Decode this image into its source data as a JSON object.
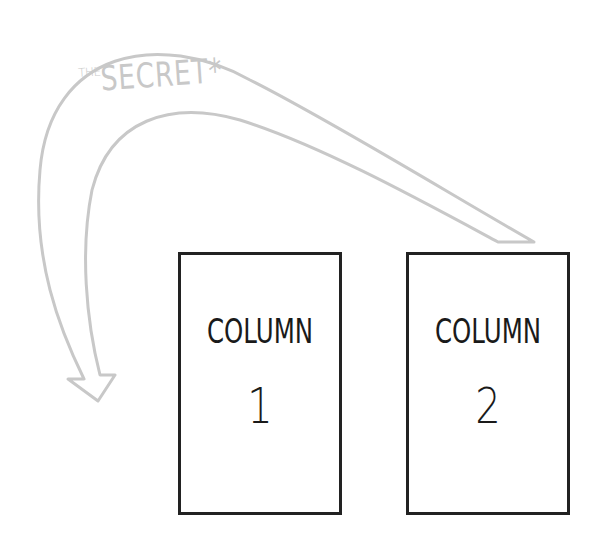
{
  "diagram": {
    "arrow": {
      "label_prefix": "THE",
      "label_main": "SECRET*",
      "color": "#c8c8c8",
      "direction": "from column 2 over the top back to the left of column 1"
    },
    "columns": [
      {
        "title": "COLUMN",
        "number": "1"
      },
      {
        "title": "COLUMN",
        "number": "2"
      }
    ],
    "box_border_color": "#222222"
  }
}
